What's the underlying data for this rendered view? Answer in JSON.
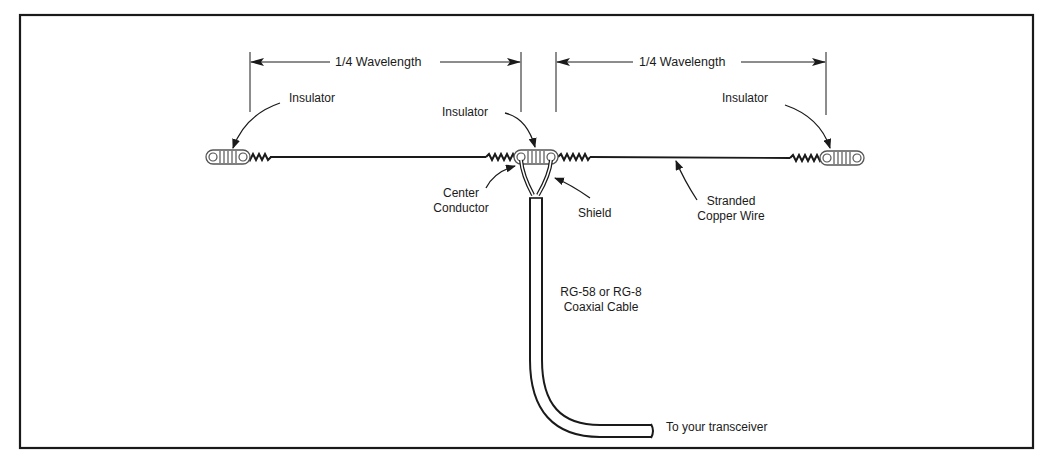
{
  "diagram": {
    "type": "dipole-antenna",
    "colors": {
      "line": "#1a1a1a",
      "background": "#ffffff",
      "insulator_fill": "#ffffff",
      "insulator_stroke": "#555555"
    },
    "dimensions": [
      {
        "label": "1/4 Wavelength"
      },
      {
        "label": "1/4 Wavelength"
      }
    ],
    "labels": {
      "insulator_left": "Insulator",
      "insulator_center": "Insulator",
      "insulator_right": "Insulator",
      "center_conductor_line1": "Center",
      "center_conductor_line2": "Conductor",
      "shield": "Shield",
      "stranded_line1": "Stranded",
      "stranded_line2": "Copper Wire",
      "coax_line1": "RG-58 or RG-8",
      "coax_line2": "Coaxial Cable",
      "transceiver": "To your transceiver"
    }
  }
}
